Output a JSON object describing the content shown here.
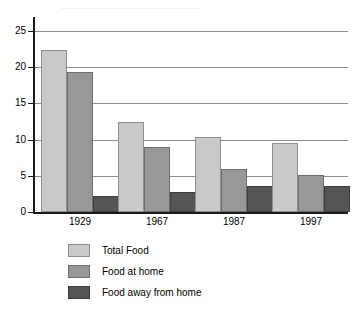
{
  "chart_data": {
    "type": "bar",
    "title": "",
    "subtitle": "",
    "xlabel": "",
    "ylabel": "",
    "categories": [
      "1929",
      "1967",
      "1987",
      "1997"
    ],
    "series": [
      {
        "name": "Total Food",
        "color": "#c9c9c9",
        "values": [
          22.4,
          12.5,
          10.4,
          9.5
        ]
      },
      {
        "name": "Food at home",
        "color": "#989898",
        "values": [
          19.3,
          9.0,
          6.0,
          5.1
        ]
      },
      {
        "name": "Food away from home",
        "color": "#555555",
        "values": [
          2.2,
          2.7,
          3.6,
          3.6
        ]
      }
    ],
    "ylim": [
      0,
      25
    ],
    "yticks": [
      0,
      5,
      10,
      15,
      20,
      25
    ],
    "ytick_labels": [
      "0",
      "5",
      "10",
      "15",
      "20",
      "25"
    ],
    "grid": true,
    "legend_position": "bottom-left"
  },
  "axes": {
    "y_tick_labels": [
      "25",
      "20",
      "15",
      "10",
      "5",
      "0"
    ],
    "x_tick_labels": [
      "1929",
      "1967",
      "1987",
      "1997"
    ]
  },
  "legend": {
    "entries": [
      {
        "label": "Total Food"
      },
      {
        "label": "Food at home"
      },
      {
        "label": "Food away from home"
      }
    ]
  },
  "artifacts": {
    "watermark_text": ""
  }
}
